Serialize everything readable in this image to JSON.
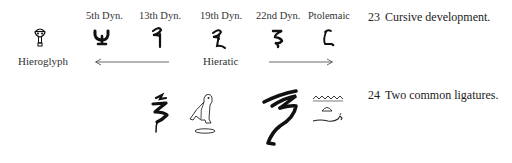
{
  "figure23": {
    "columns": [
      {
        "label": "5th Dyn."
      },
      {
        "label": "13th Dyn."
      },
      {
        "label": "19th Dyn."
      },
      {
        "label": "22nd Dyn."
      },
      {
        "label": "Ptolemaic"
      }
    ],
    "hieroglyph_label": "Hieroglyph",
    "hieratic_label": "Hieratic",
    "caption_number": "23",
    "caption_text": "Cursive development."
  },
  "figure24": {
    "caption_number": "24",
    "caption_text": "Two common ligatures."
  },
  "icons": {
    "hieroglyph": "nfr-sign-icon",
    "ligatures": [
      "hieratic-ligature-1-icon",
      "owl-hieroglyph-icon",
      "hieratic-ligature-2-icon",
      "water-bread-snake-hieroglyph-icon"
    ]
  },
  "colors": {
    "ink": "#111111",
    "background": "#ffffff",
    "text": "#333333"
  }
}
